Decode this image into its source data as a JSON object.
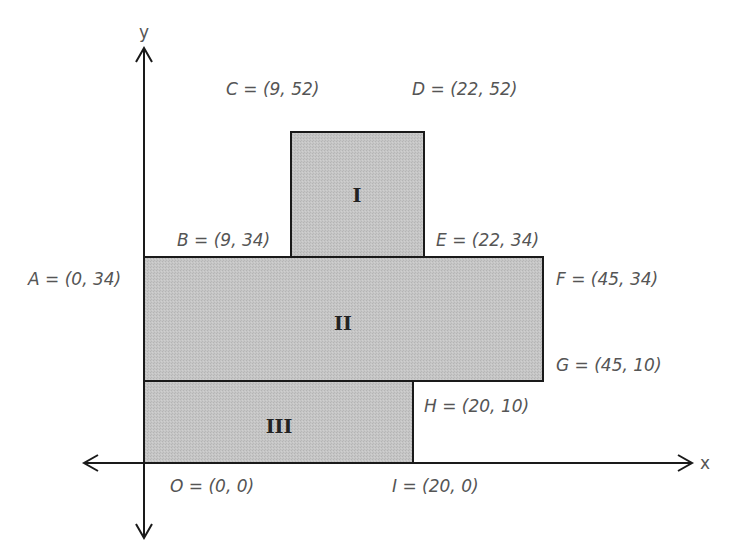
{
  "diagram": {
    "type": "coordinate-plane-composite-rectangles",
    "axes": {
      "x_label": "x",
      "y_label": "y"
    },
    "colors": {
      "fill": "#c4c4c4",
      "stroke": "#1a1a1a",
      "label_text": "#555555"
    },
    "regions": [
      {
        "id": "I",
        "label": "I",
        "corners": [
          "B",
          "C",
          "D",
          "E"
        ]
      },
      {
        "id": "II",
        "label": "II",
        "corners": [
          "A",
          "F",
          "G"
        ]
      },
      {
        "id": "III",
        "label": "III",
        "corners": [
          "O",
          "I",
          "H"
        ]
      }
    ],
    "points": {
      "A": {
        "text": "A = (0, 34)",
        "x": 0,
        "y": 34
      },
      "B": {
        "text": "B = (9, 34)",
        "x": 9,
        "y": 34
      },
      "C": {
        "text": "C = (9, 52)",
        "x": 9,
        "y": 52
      },
      "D": {
        "text": "D = (22, 52)",
        "x": 22,
        "y": 52
      },
      "E": {
        "text": "E = (22, 34)",
        "x": 22,
        "y": 34
      },
      "F": {
        "text": "F = (45, 34)",
        "x": 45,
        "y": 34
      },
      "G": {
        "text": "G = (45, 10)",
        "x": 45,
        "y": 10
      },
      "H": {
        "text": "H = (20, 10)",
        "x": 20,
        "y": 10
      },
      "O": {
        "text": "O = (0, 0)",
        "x": 0,
        "y": 0
      },
      "I": {
        "text": "I = (20, 0)",
        "x": 20,
        "y": 0
      }
    }
  }
}
